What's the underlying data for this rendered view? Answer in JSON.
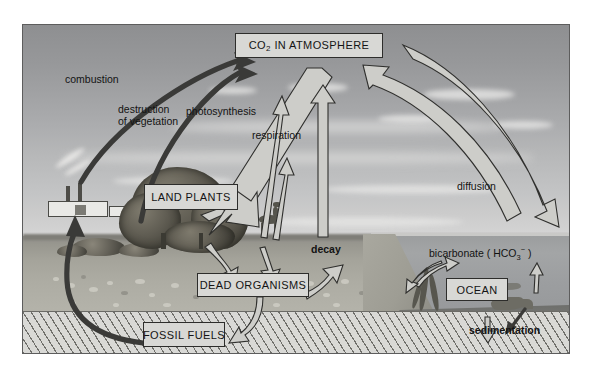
{
  "diagram": {
    "type": "carbon-cycle-diagram",
    "frame": {
      "border_color": "#5d5d5d"
    },
    "reservoirs": [
      {
        "id": "atmosphere",
        "label": "CO",
        "label_sub": "2",
        "label_rest": " IN ATMOSPHERE"
      },
      {
        "id": "land_plants",
        "label": "LAND PLANTS"
      },
      {
        "id": "dead_organisms",
        "label": "DEAD ORGANISMS"
      },
      {
        "id": "fossil_fuels",
        "label": "FOSSIL FUELS"
      },
      {
        "id": "ocean",
        "label": "OCEAN"
      }
    ],
    "flux_labels": [
      {
        "id": "combustion",
        "text": "combustion"
      },
      {
        "id": "destruction",
        "line1": "destruction",
        "line2": "of vegetation"
      },
      {
        "id": "photosynthesis",
        "text": "photosynthesis"
      },
      {
        "id": "respiration",
        "text": "respiration"
      },
      {
        "id": "decay",
        "text": "decay"
      },
      {
        "id": "diffusion",
        "text": "diffusion"
      },
      {
        "id": "bicarbonate",
        "text": "bicarbonate ( HCO",
        "sub": "3",
        "sup": "−",
        "tail": " )"
      },
      {
        "id": "sedimentation",
        "text": "sedimentation"
      }
    ],
    "scene": {
      "sky_label": "sky",
      "land_label": "land",
      "ocean_label": "ocean",
      "bedrock_label": "bedrock"
    },
    "colors": {
      "box_fill": "#d8d8d5",
      "box_border": "#2d2d2b",
      "arrow_outline_fill": "#cdcdc9",
      "arrow_outline_stroke": "#2f2f2d",
      "arrow_solid": "#3a3a38",
      "text": "#131313"
    }
  }
}
